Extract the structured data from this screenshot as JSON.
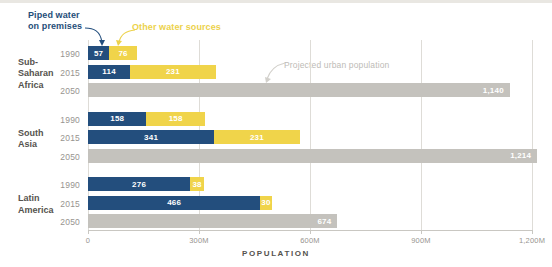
{
  "legend": {
    "piped_label": "Piped water\non premises",
    "other_label": "Other water sources",
    "piped_color": "#234e7d",
    "other_color": "#f0d44a",
    "projected_color": "#c4c2bd"
  },
  "annotation": {
    "projected_text": "Projected urban population"
  },
  "axis": {
    "title": "POPULATION",
    "ticks": [
      "0",
      "300M",
      "600M",
      "900M",
      "1,200M"
    ],
    "tick_values": [
      0,
      300,
      600,
      900,
      1200
    ]
  },
  "regions": [
    {
      "name": "Sub-\nSaharan\nAfrica",
      "rows": [
        {
          "year": "1990",
          "piped": 57,
          "other": 76,
          "piped_label": "57",
          "other_label": "76"
        },
        {
          "year": "2015",
          "piped": 114,
          "other": 231,
          "piped_label": "114",
          "other_label": "231"
        },
        {
          "year": "2050",
          "projected": 1140,
          "projected_label": "1,140"
        }
      ]
    },
    {
      "name": "South\nAsia",
      "rows": [
        {
          "year": "1990",
          "piped": 158,
          "other": 158,
          "piped_label": "158",
          "other_label": "158"
        },
        {
          "year": "2015",
          "piped": 341,
          "other": 231,
          "piped_label": "341",
          "other_label": "231"
        },
        {
          "year": "2050",
          "projected": 1214,
          "projected_label": "1,214"
        }
      ]
    },
    {
      "name": "Latin\nAmerica",
      "rows": [
        {
          "year": "1990",
          "piped": 276,
          "other": 38,
          "piped_label": "276",
          "other_label": "38"
        },
        {
          "year": "2015",
          "piped": 466,
          "other": 30,
          "piped_label": "466",
          "other_label": "30"
        },
        {
          "year": "2050",
          "projected": 674,
          "projected_label": "674"
        }
      ]
    }
  ],
  "chart_data": {
    "type": "bar",
    "title": "",
    "subtitle": "",
    "orientation": "horizontal",
    "stacked": true,
    "xlabel": "POPULATION",
    "ylabel": "",
    "xlim": [
      0,
      1200
    ],
    "xticks": [
      0,
      300,
      600,
      900,
      1200
    ],
    "xticklabels": [
      "0",
      "300M",
      "600M",
      "900M",
      "1,200M"
    ],
    "grid": "vertical",
    "legend_position": "top-left",
    "legend": [
      "Piped water on premises",
      "Other water sources",
      "Projected urban population"
    ],
    "annotations": [
      "Projected urban population"
    ],
    "categories": [
      "Sub-Saharan Africa 1990",
      "Sub-Saharan Africa 2015",
      "Sub-Saharan Africa 2050",
      "South Asia 1990",
      "South Asia 2015",
      "South Asia 2050",
      "Latin America 1990",
      "Latin America 2015",
      "Latin America 2050"
    ],
    "series": [
      {
        "name": "Piped water on premises",
        "color": "#234e7d",
        "values": [
          57,
          114,
          null,
          158,
          341,
          null,
          276,
          466,
          null
        ]
      },
      {
        "name": "Other water sources",
        "color": "#f0d44a",
        "values": [
          76,
          231,
          null,
          158,
          231,
          null,
          38,
          30,
          null
        ]
      },
      {
        "name": "Projected urban population",
        "color": "#c4c2bd",
        "values": [
          null,
          null,
          1140,
          null,
          null,
          1214,
          null,
          null,
          674
        ]
      }
    ],
    "units": "millions of people"
  }
}
